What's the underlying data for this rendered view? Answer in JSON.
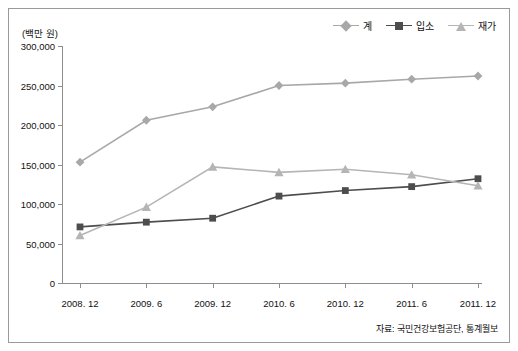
{
  "axis_title": "(백만 원)",
  "source": "자료: 국민건강보험공단, 통계월보",
  "legend": [
    {
      "label": "계",
      "color": "#a8a8a8",
      "marker": "diamond"
    },
    {
      "label": "입소",
      "color": "#4d4d4d",
      "marker": "square"
    },
    {
      "label": "재가",
      "color": "#b5b5b5",
      "marker": "triangle"
    }
  ],
  "chart_data": {
    "type": "line",
    "title": "",
    "xlabel": "",
    "ylabel": "(백만 원)",
    "categories": [
      "2008. 12",
      "2009. 6",
      "2009. 12",
      "2010. 6",
      "2010. 12",
      "2011. 6",
      "2011. 12"
    ],
    "ylim": [
      0,
      300000
    ],
    "yticks": [
      0,
      50000,
      100000,
      150000,
      200000,
      250000,
      300000
    ],
    "ytick_labels": [
      "0",
      "50,000",
      "100,000",
      "150,000",
      "200,000",
      "250,000",
      "300,000"
    ],
    "grid": false,
    "legend_position": "top-right",
    "series": [
      {
        "name": "계",
        "color": "#a8a8a8",
        "marker": "diamond",
        "values": [
          153000,
          206000,
          223000,
          250000,
          253000,
          258000,
          262000
        ]
      },
      {
        "name": "입소",
        "color": "#4d4d4d",
        "marker": "square",
        "values": [
          71000,
          77000,
          82000,
          110000,
          117000,
          122000,
          132000
        ]
      },
      {
        "name": "재가",
        "color": "#b5b5b5",
        "marker": "triangle",
        "values": [
          60000,
          96000,
          147000,
          140000,
          144000,
          137000,
          123000
        ]
      }
    ]
  }
}
